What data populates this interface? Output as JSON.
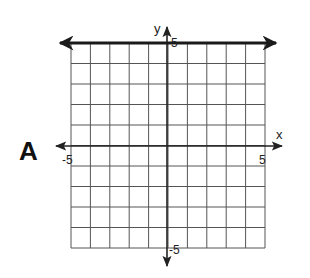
{
  "choice_label": "A",
  "graph": {
    "x_axis_label": "x",
    "y_axis_label": "y",
    "x_min": -5,
    "x_max": 5,
    "y_min": -5,
    "y_max": 5,
    "tick_labels": {
      "x_min": "-5",
      "x_max": "5",
      "y_min": "-5",
      "y_max": "5"
    },
    "grid_step": 1,
    "plotted_line": {
      "equation": "y = 5",
      "type": "horizontal",
      "y": 5
    }
  },
  "colors": {
    "grid": "#555555",
    "axis": "#222222",
    "line": "#1a1a1a",
    "background": "#ffffff"
  },
  "chart_data": {
    "type": "line",
    "title": "",
    "xlabel": "x",
    "ylabel": "y",
    "xlim": [
      -5,
      5
    ],
    "ylim": [
      -5,
      5
    ],
    "grid": true,
    "series": [
      {
        "name": "y = 5",
        "x": [
          -5,
          5
        ],
        "y": [
          5,
          5
        ]
      }
    ],
    "annotations": [
      "A"
    ]
  }
}
